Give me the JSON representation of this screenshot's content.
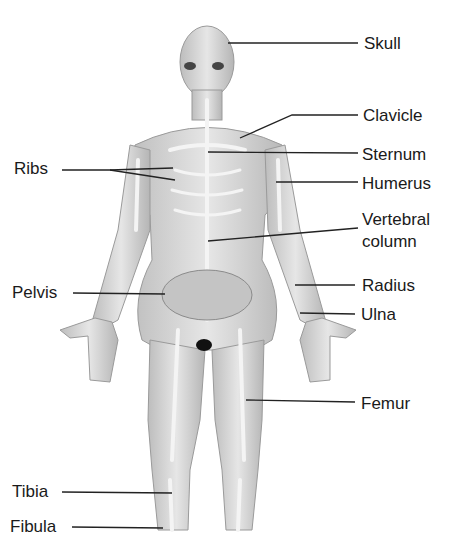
{
  "diagram": {
    "type": "anatomical-labeled-illustration",
    "labels": [
      {
        "id": "skull",
        "text": "Skull"
      },
      {
        "id": "clavicle",
        "text": "Clavicle"
      },
      {
        "id": "sternum",
        "text": "Sternum"
      },
      {
        "id": "ribs",
        "text": "Ribs"
      },
      {
        "id": "humerus",
        "text": "Humerus"
      },
      {
        "id": "vertebral",
        "text": "Vertebral",
        "text2": "column"
      },
      {
        "id": "pelvis",
        "text": "Pelvis"
      },
      {
        "id": "radius",
        "text": "Radius"
      },
      {
        "id": "ulna",
        "text": "Ulna"
      },
      {
        "id": "femur",
        "text": "Femur"
      },
      {
        "id": "tibia",
        "text": "Tibia"
      },
      {
        "id": "fibula",
        "text": "Fibula"
      }
    ],
    "colors": {
      "text": "#1a1a1a",
      "leader": "#222222",
      "body": "#d4d4d4",
      "bone": "#f2f2f2",
      "shade": "#a8a8a8"
    }
  }
}
